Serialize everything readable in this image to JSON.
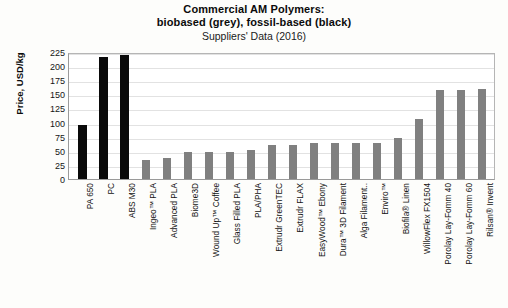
{
  "chart_data": {
    "type": "bar",
    "title": "Commercial AM Polymers:",
    "title_line2": "biobased (grey), fossil-based (black)",
    "subtitle": "Suppliers' Data (2016)",
    "xlabel": "",
    "ylabel": "Price, USD/kg",
    "ylim": [
      0,
      225
    ],
    "yticks": [
      225,
      200,
      175,
      150,
      125,
      100,
      75,
      50,
      25,
      0
    ],
    "grid": true,
    "legend": "none",
    "colors": {
      "fossil_based": "#0a0a0a",
      "biobased": "#808080",
      "gridline": "#e2e2e2",
      "axis": "#9a9a9a",
      "background": "#fdfdfb"
    },
    "categories": [
      "PA 650",
      "PC",
      "ABS M30",
      "Ingeo™ PLA",
      "Advanced PLA",
      "Biome3D",
      "Wound Up™ Coffee",
      "Glass Filled PLA",
      "PLA/PHA",
      "Extrudr GreenTEC",
      "Extrudr FLAX",
      "EasyWood™ Ebony",
      "Dura™ 3D Filament",
      "Alga Filament..",
      "Enviro™",
      "Biofila® Linen",
      "WillowFlex FX1504",
      "Porolay Lay-Fomm 40",
      "Porolay Lay-Fomm 60",
      "Rilsan® Invent"
    ],
    "values": [
      95,
      216,
      219,
      34,
      38,
      48,
      47,
      47,
      52,
      60,
      60,
      63,
      63,
      64,
      63,
      73,
      106,
      157,
      157,
      160
    ],
    "bar_types": [
      "fossil",
      "fossil",
      "fossil",
      "bio",
      "bio",
      "bio",
      "bio",
      "bio",
      "bio",
      "bio",
      "bio",
      "bio",
      "bio",
      "bio",
      "bio",
      "bio",
      "bio",
      "bio",
      "bio",
      "bio"
    ]
  }
}
